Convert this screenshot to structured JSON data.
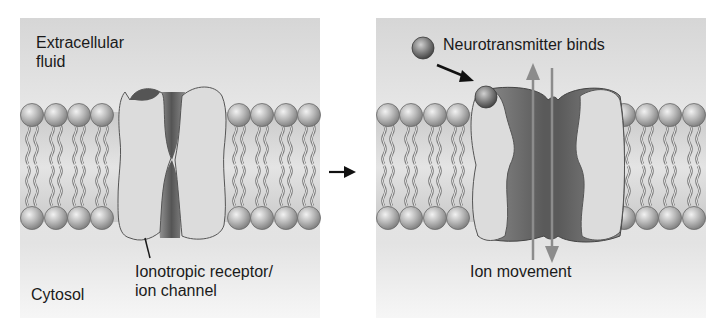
{
  "figure": {
    "panels": [
      {
        "id": "closed",
        "labels": {
          "region_top_line1": "Extracellular",
          "region_top_line2": "fluid",
          "region_bottom": "Cytosol",
          "receptor_line1": "Ionotropic receptor/",
          "receptor_line2": "ion channel"
        }
      },
      {
        "id": "open",
        "labels": {
          "ligand": "Neurotransmitter binds",
          "ion_flow": "Ion movement"
        }
      }
    ],
    "transition_arrow": "right-arrow",
    "colors": {
      "background_top": "#d9d9d9",
      "background_bottom": "#f2f2f2",
      "membrane_band": "#bdbdbd",
      "lipid_head": "#b5b5b5",
      "protein_light": "#dcdcdc",
      "protein_dark": "#6e6e6e",
      "ligand": "#8a8a8a",
      "ion_arrow": "#8c8c8c",
      "text": "#1a1a1a"
    }
  }
}
